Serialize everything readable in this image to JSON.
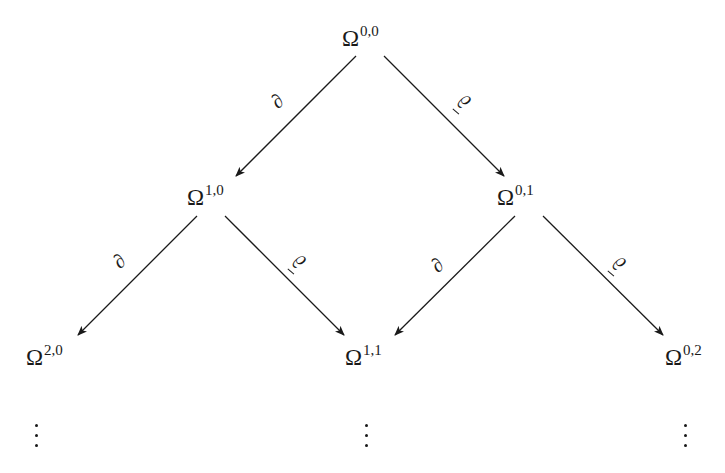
{
  "diagram": {
    "type": "double-complex",
    "nodes": [
      {
        "id": "n00",
        "symbol": "Ω",
        "sup": "0,0",
        "x": 342,
        "y": 27
      },
      {
        "id": "n10",
        "symbol": "Ω",
        "sup": "1,0",
        "x": 187,
        "y": 186
      },
      {
        "id": "n01",
        "symbol": "Ω",
        "sup": "0,1",
        "x": 497,
        "y": 186
      },
      {
        "id": "n20",
        "symbol": "Ω",
        "sup": "2,0",
        "x": 26,
        "y": 346
      },
      {
        "id": "n11",
        "symbol": "Ω",
        "sup": "1,1",
        "x": 345,
        "y": 346
      },
      {
        "id": "n02",
        "symbol": "Ω",
        "sup": "0,2",
        "x": 665,
        "y": 346
      }
    ],
    "edges": [
      {
        "from": "n00",
        "to": "n10",
        "label": "∂",
        "kind": "d"
      },
      {
        "from": "n00",
        "to": "n01",
        "label": "∂̄",
        "kind": "dbar"
      },
      {
        "from": "n10",
        "to": "n20",
        "label": "∂",
        "kind": "d"
      },
      {
        "from": "n10",
        "to": "n11",
        "label": "∂̄",
        "kind": "dbar"
      },
      {
        "from": "n01",
        "to": "n11",
        "label": "∂",
        "kind": "d"
      },
      {
        "from": "n01",
        "to": "n02",
        "label": "∂̄",
        "kind": "dbar"
      }
    ],
    "continuation": "⋮",
    "labels": {
      "d": "∂",
      "dbar": "∂"
    },
    "stroke_color": "#1a1a1a"
  }
}
